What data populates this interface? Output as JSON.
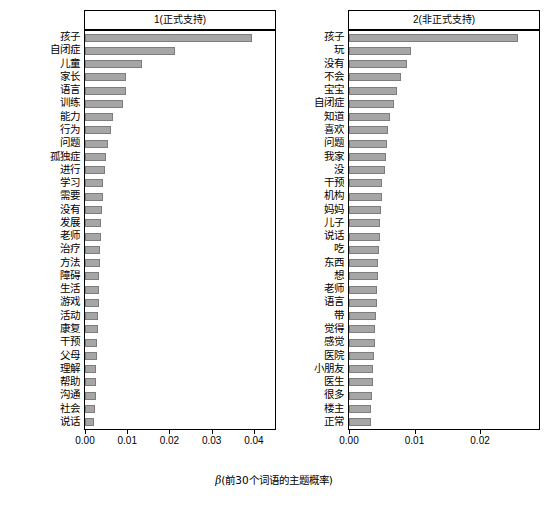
{
  "chart_data": {
    "type": "bar",
    "title": "",
    "xlabel": "β(前30个词语的主题概率)",
    "ylabel": "",
    "orientation": "horizontal",
    "grid": false,
    "legend": null,
    "panels": [
      {
        "panel_title": "1(正式支持)",
        "xlim": [
          0,
          0.045
        ],
        "xticks": [
          0.0,
          0.01,
          0.02,
          0.03,
          0.04
        ],
        "xticklabels": [
          "0.00",
          "0.01",
          "0.02",
          "0.03",
          "0.04"
        ],
        "categories": [
          "孩子",
          "自闭症",
          "儿童",
          "家长",
          "语言",
          "训练",
          "能力",
          "行为",
          "问题",
          "孤独症",
          "进行",
          "学习",
          "需要",
          "没有",
          "发展",
          "老师",
          "治疗",
          "方法",
          "障碍",
          "生活",
          "游戏",
          "活动",
          "康复",
          "干预",
          "父母",
          "理解",
          "帮助",
          "沟通",
          "社会",
          "说话"
        ],
        "values": [
          0.0395,
          0.0213,
          0.0135,
          0.0098,
          0.0096,
          0.009,
          0.0066,
          0.0062,
          0.0055,
          0.005,
          0.0048,
          0.0043,
          0.0042,
          0.004,
          0.0038,
          0.0037,
          0.0036,
          0.0035,
          0.0034,
          0.0033,
          0.0032,
          0.0031,
          0.003,
          0.0029,
          0.0028,
          0.0027,
          0.0026,
          0.0025,
          0.0024,
          0.0022
        ]
      },
      {
        "panel_title": "2(非正式支持)",
        "xlim": [
          0,
          0.029
        ],
        "xticks": [
          0.0,
          0.01,
          0.02
        ],
        "xticklabels": [
          "0.00",
          "0.01",
          "0.02"
        ],
        "categories": [
          "孩子",
          "玩",
          "没有",
          "不会",
          "宝宝",
          "自闭症",
          "知道",
          "喜欢",
          "问题",
          "我家",
          "没",
          "干预",
          "机构",
          "妈妈",
          "儿子",
          "说话",
          "吃",
          "东西",
          "想",
          "老师",
          "语言",
          "带",
          "觉得",
          "感觉",
          "医院",
          "小朋友",
          "医生",
          "很多",
          "楼主",
          "正常"
        ],
        "values": [
          0.0258,
          0.0095,
          0.0089,
          0.008,
          0.0074,
          0.0068,
          0.0063,
          0.006,
          0.0058,
          0.0057,
          0.0055,
          0.0051,
          0.005,
          0.0049,
          0.0048,
          0.0047,
          0.0046,
          0.0045,
          0.0044,
          0.0043,
          0.0042,
          0.0041,
          0.004,
          0.0039,
          0.0038,
          0.0037,
          0.0036,
          0.0035,
          0.0034,
          0.0033
        ]
      }
    ],
    "bar_color": "#a6a6a6"
  }
}
